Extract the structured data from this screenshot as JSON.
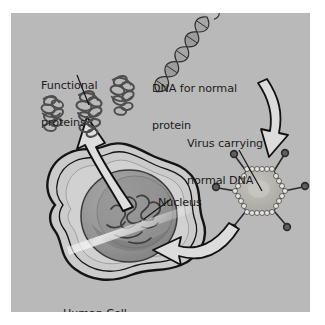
{
  "figure": {
    "domain": "biology-diagram",
    "topic": "gene therapy using a viral vector",
    "background_color": "#b9b9b9",
    "page_color": "#ffffff",
    "ink_color": "#1c1c1c",
    "panel": {
      "x": 11,
      "y": 13,
      "width": 299,
      "height": 299
    }
  },
  "labels": {
    "functional_proteins": {
      "line1": "Functional",
      "line2": "proteins",
      "x": 41,
      "y": 55
    },
    "dna_for_normal_protein": {
      "line1": "DNA for normal",
      "line2": "protein",
      "x": 152,
      "y": 58
    },
    "virus_carrying_normal_dna": {
      "line1": "Virus carrying",
      "line2": "normal DNA",
      "x": 187,
      "y": 113
    },
    "nucleus": {
      "line1": "Nucleus",
      "x": 158,
      "y": 172
    },
    "human_cell": {
      "line1": "Human Cell",
      "x": 63,
      "y": 283
    }
  },
  "elements": {
    "dna_helix": {
      "name": "dna-double-helix",
      "segments": 5,
      "orientation": "diagonal-down-left",
      "fill": "#8d8d8d"
    },
    "virus": {
      "name": "virus-capsid",
      "shape": "hexagon",
      "spikes": 6,
      "capsomere_beads": 30,
      "fill": "#b0b0ad"
    },
    "cell": {
      "name": "human-cell",
      "shape": "amoeboid-lobed",
      "membrane": "double-line",
      "fill": "#c9c9c9"
    },
    "nucleus_body": {
      "name": "nucleus-sphere",
      "fill": "#9a9a9a",
      "chromatin": "squiggles"
    },
    "proteins": {
      "name": "protein-cluster",
      "count": 3,
      "shape": "tangled-coils",
      "fill": "#909090"
    },
    "arrow_dna_to_virus": {
      "name": "arrow-dna-to-virus",
      "style": "hollow-outlined-curved",
      "direction": "down"
    },
    "arrow_virus_to_nucleus": {
      "name": "arrow-virus-to-nucleus",
      "style": "hollow-outlined-curved",
      "direction": "left"
    },
    "arrow_nucleus_to_proteins": {
      "name": "arrow-nucleus-to-proteins",
      "style": "hollow-outlined-curved",
      "direction": "up"
    }
  }
}
